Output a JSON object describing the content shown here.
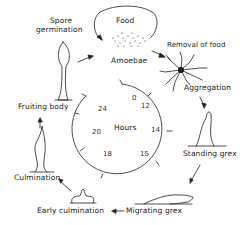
{
  "diagram": {
    "title": "",
    "stages": [
      {
        "id": "food",
        "label": "Food"
      },
      {
        "id": "amoebae",
        "label": "Amoebae"
      },
      {
        "id": "removal",
        "label": "Removal of food"
      },
      {
        "id": "aggregation",
        "label": "Aggregation"
      },
      {
        "id": "standing",
        "label": "Standing grex"
      },
      {
        "id": "migrating",
        "label": "Migrating grex"
      },
      {
        "id": "early",
        "label": "Early culmination"
      },
      {
        "id": "culmination",
        "label": "Culmination"
      },
      {
        "id": "fruiting",
        "label": "Fruiting body"
      },
      {
        "id": "spore_line1",
        "label": "Spore"
      },
      {
        "id": "spore_line2",
        "label": "germination"
      }
    ],
    "clock": {
      "center_label": "Hours",
      "ticks": [
        "0",
        "12",
        "14",
        "15",
        "18",
        "20",
        "24"
      ]
    }
  }
}
